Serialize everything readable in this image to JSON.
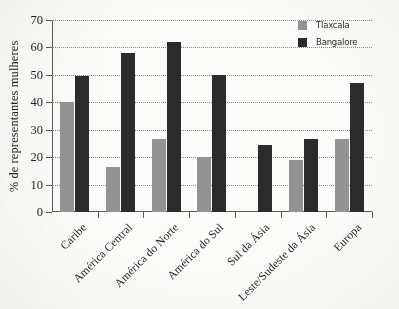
{
  "chart_data": {
    "type": "bar",
    "title": "",
    "xlabel": "",
    "ylabel": "% de representantes mulheres",
    "ylim": [
      0,
      70
    ],
    "ytick_step": 10,
    "yticks": [
      0,
      10,
      20,
      30,
      40,
      50,
      60,
      70
    ],
    "grid": true,
    "legend_position": "top-right",
    "categories": [
      "Caribe",
      "América Central",
      "América do Norte",
      "América do Sul",
      "Sul da Ásia",
      "Leste/Sudeste da Ásia",
      "Europa"
    ],
    "series": [
      {
        "name": "Tlaxcala",
        "color": "#939393",
        "values": [
          40,
          16.5,
          26.5,
          20,
          null,
          19,
          26.5
        ]
      },
      {
        "name": "Bangalore",
        "color": "#2b2b2b",
        "values": [
          49.5,
          58,
          62,
          50,
          24.5,
          26.5,
          47
        ]
      }
    ]
  },
  "legend": {
    "items": [
      {
        "label": "Tlaxcala",
        "color": "#939393"
      },
      {
        "label": "Bangalore",
        "color": "#2b2b2b"
      }
    ]
  },
  "axes": {
    "y_title": "% de representantes mulheres"
  },
  "colors": {
    "tlaxcala": "#939393",
    "bangalore": "#2b2b2b",
    "axis": "#5b5b58",
    "grid": "#8e8e88",
    "background": "#fbfbf9"
  }
}
